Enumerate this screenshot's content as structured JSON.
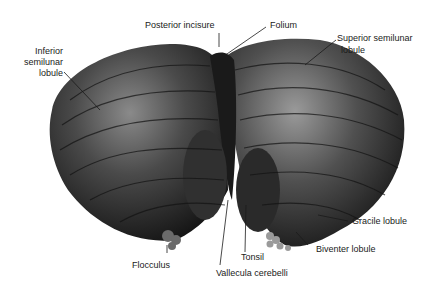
{
  "figure": {
    "labels": {
      "posterior_incisure": "Posterior incisure",
      "folium": "Folium",
      "inferior_semilunar_1": "Inferior",
      "inferior_semilunar_2": "semilunar",
      "inferior_semilunar_3": "lobule",
      "superior_semilunar_1": "Superior semilunar",
      "superior_semilunar_2": "lobule",
      "gracile_lobule": "Gracile lobule",
      "biventer_lobule": "Biventer lobule",
      "tonsil": "Tonsil",
      "flocculus": "Flocculus",
      "vallecula_cerebelli": "Vallecula cerebelli"
    }
  }
}
